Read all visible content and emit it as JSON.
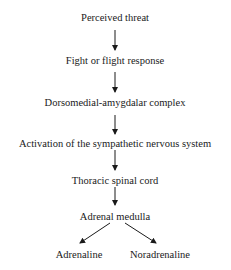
{
  "diagram": {
    "type": "flowchart",
    "nodes": [
      {
        "id": "n1",
        "label": "Perceived threat"
      },
      {
        "id": "n2",
        "label": "Fight or flight response"
      },
      {
        "id": "n3",
        "label": "Dorsomedial-amygdalar complex"
      },
      {
        "id": "n4",
        "label": "Activation of the sympathetic nervous system"
      },
      {
        "id": "n5",
        "label": "Thoracic spinal cord"
      },
      {
        "id": "n6",
        "label": "Adrenal medulla"
      },
      {
        "id": "n7",
        "label": "Adrenaline"
      },
      {
        "id": "n8",
        "label": "Noradrenaline"
      }
    ],
    "edges": [
      {
        "from": "n1",
        "to": "n2"
      },
      {
        "from": "n2",
        "to": "n3"
      },
      {
        "from": "n3",
        "to": "n4"
      },
      {
        "from": "n4",
        "to": "n5"
      },
      {
        "from": "n5",
        "to": "n6"
      },
      {
        "from": "n6",
        "to": "n7"
      },
      {
        "from": "n6",
        "to": "n8"
      }
    ],
    "colors": {
      "text": "#1a1a1a",
      "arrow": "#1a1a1a",
      "background": "#ffffff"
    }
  }
}
